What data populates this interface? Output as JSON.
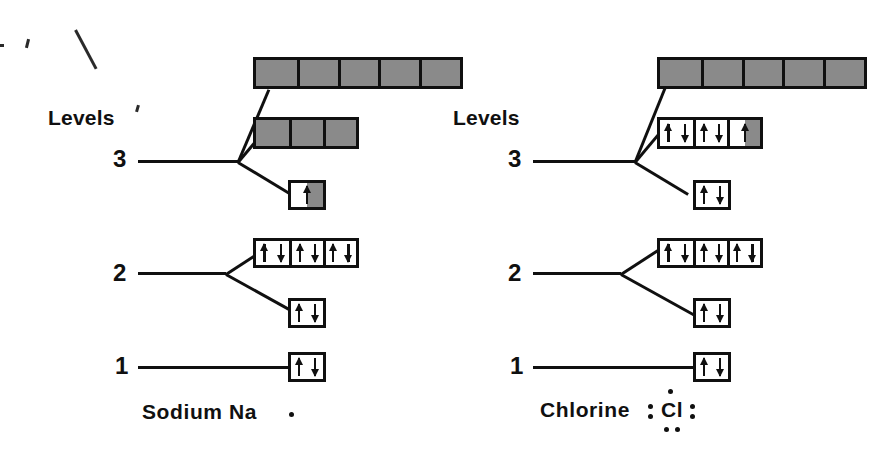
{
  "figure": {
    "title_text": "Electron energy level diagrams for Sodium and Chlorine",
    "axis_label": "Levels",
    "colors": {
      "ink": "#101010",
      "empty_orbital_fill": "#8a8a8a",
      "filled_orbital_fill": "#ffffff",
      "background": "#ffffff"
    }
  },
  "diagrams": [
    {
      "id": "sodium",
      "levels_label": "Levels",
      "element_label": "Sodium  Na",
      "element_symbol": "Na",
      "element_name": "Sodium",
      "lewis_dots": 1,
      "level_numbers": {
        "three": "3",
        "two": "2",
        "one": "1"
      },
      "shells": [
        {
          "level": "3",
          "subshells": [
            {
              "name": "3d",
              "boxes": 5,
              "occupancy": [
                "empty",
                "empty",
                "empty",
                "empty",
                "empty"
              ]
            },
            {
              "name": "3p",
              "boxes": 3,
              "occupancy": [
                "empty",
                "empty",
                "empty"
              ]
            },
            {
              "name": "3s",
              "boxes": 1,
              "occupancy": [
                "half"
              ]
            }
          ]
        },
        {
          "level": "2",
          "subshells": [
            {
              "name": "2p",
              "boxes": 3,
              "occupancy": [
                "full",
                "full",
                "full"
              ]
            },
            {
              "name": "2s",
              "boxes": 1,
              "occupancy": [
                "full"
              ]
            }
          ]
        },
        {
          "level": "1",
          "subshells": [
            {
              "name": "1s",
              "boxes": 1,
              "occupancy": [
                "full"
              ]
            }
          ]
        }
      ]
    },
    {
      "id": "chlorine",
      "levels_label": "Levels",
      "element_label": "Chlorine",
      "element_symbol": "Cl",
      "element_name": "Chlorine",
      "lewis_dots": 7,
      "level_numbers": {
        "three": "3",
        "two": "2",
        "one": "1"
      },
      "shells": [
        {
          "level": "3",
          "subshells": [
            {
              "name": "3d",
              "boxes": 5,
              "occupancy": [
                "empty",
                "empty",
                "empty",
                "empty",
                "empty"
              ]
            },
            {
              "name": "3p",
              "boxes": 3,
              "occupancy": [
                "full",
                "full",
                "half"
              ]
            },
            {
              "name": "3s",
              "boxes": 1,
              "occupancy": [
                "full"
              ]
            }
          ]
        },
        {
          "level": "2",
          "subshells": [
            {
              "name": "2p",
              "boxes": 3,
              "occupancy": [
                "full",
                "full",
                "full"
              ]
            },
            {
              "name": "2s",
              "boxes": 1,
              "occupancy": [
                "full"
              ]
            }
          ]
        },
        {
          "level": "1",
          "subshells": [
            {
              "name": "1s",
              "boxes": 1,
              "occupancy": [
                "full"
              ]
            }
          ]
        }
      ]
    }
  ]
}
